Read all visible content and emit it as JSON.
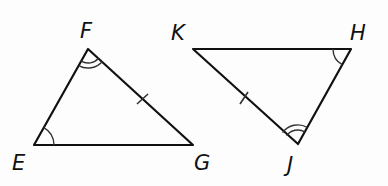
{
  "diagram": {
    "type": "congruent-triangles",
    "triangles": [
      {
        "name": "triangle-EFG",
        "vertices": [
          {
            "label": "F",
            "x": 88,
            "y": 49,
            "lx": 80,
            "ly": 38
          },
          {
            "label": "E",
            "x": 34,
            "y": 145,
            "lx": 12,
            "ly": 170
          },
          {
            "label": "G",
            "x": 193,
            "y": 145,
            "lx": 194,
            "ly": 170
          }
        ]
      },
      {
        "name": "triangle-KHJ",
        "vertices": [
          {
            "label": "K",
            "x": 193,
            "y": 49,
            "lx": 172,
            "ly": 38
          },
          {
            "label": "H",
            "x": 351,
            "y": 49,
            "lx": 350,
            "ly": 38
          },
          {
            "label": "J",
            "x": 298,
            "y": 144,
            "lx": 287,
            "ly": 172
          }
        ]
      }
    ],
    "markings": {
      "single_arc_angles": [
        "E",
        "H"
      ],
      "double_arc_angles": [
        "F",
        "J"
      ],
      "single_tick_sides": [
        "FG",
        "KJ"
      ]
    },
    "labels": {
      "F": "F",
      "E": "E",
      "G": "G",
      "K": "K",
      "H": "H",
      "J": "J"
    }
  }
}
